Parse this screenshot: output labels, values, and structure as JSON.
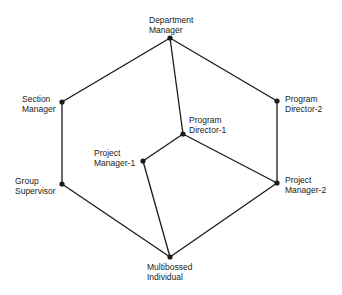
{
  "diagram": {
    "nodes": [
      {
        "id": "dept",
        "line1": "Department",
        "line2": "Manager",
        "x": 170,
        "y": 38
      },
      {
        "id": "section",
        "line1": "Section",
        "line2": "Manager",
        "x": 62,
        "y": 102
      },
      {
        "id": "pd2",
        "line1": "Program",
        "line2": "Director-2",
        "x": 277,
        "y": 101
      },
      {
        "id": "pd1",
        "line1": "Program",
        "line2": "Director-1",
        "x": 183,
        "y": 134
      },
      {
        "id": "pm1",
        "line1": "Project",
        "line2": "Manager-1",
        "x": 143,
        "y": 161
      },
      {
        "id": "group",
        "line1": "Group",
        "line2": "Supervisor",
        "x": 62,
        "y": 184
      },
      {
        "id": "pm2",
        "line1": "Project",
        "line2": "Manager-2",
        "x": 277,
        "y": 183
      },
      {
        "id": "multi",
        "line1": "Multibossed",
        "line2": "Individual",
        "x": 170,
        "y": 257
      }
    ],
    "edges": [
      [
        "dept",
        "section"
      ],
      [
        "dept",
        "pd2"
      ],
      [
        "dept",
        "pd1"
      ],
      [
        "section",
        "group"
      ],
      [
        "group",
        "multi"
      ],
      [
        "pd2",
        "pm2"
      ],
      [
        "pm2",
        "multi"
      ],
      [
        "pd1",
        "pm1"
      ],
      [
        "pd1",
        "pm2"
      ],
      [
        "pm1",
        "multi"
      ]
    ],
    "line_color": "#1a1a1a"
  }
}
